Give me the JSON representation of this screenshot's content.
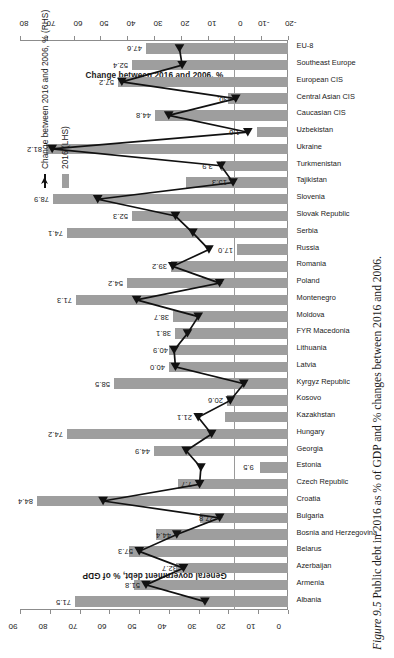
{
  "caption": {
    "number": "Figure 9.5",
    "text": "Public debt in 2016 as % of GDP and % changes between 2016 and 2006."
  },
  "legend": {
    "position": "right",
    "items": [
      {
        "label": "2016 (LHS)",
        "marker": "bar-swatch",
        "color": "#9e9e9e"
      },
      {
        "label": "Change between 2016 and 2006, % (RHS)",
        "marker": "line-marker",
        "color": "#111111"
      }
    ]
  },
  "chart_data": {
    "type": "bar",
    "title": "",
    "xlabel": "",
    "ylabel": "General government debt, % of GDP",
    "y2label": "Change between 2016 and 2006, %",
    "ylim": [
      0,
      90
    ],
    "y2lim": [
      -20,
      80
    ],
    "yticks": [
      0,
      10,
      20,
      30,
      40,
      50,
      60,
      70,
      80,
      90
    ],
    "y2ticks": [
      -20,
      -10,
      0,
      10,
      20,
      30,
      40,
      50,
      60,
      70,
      80
    ],
    "grid": false,
    "orientation": "vertical-bars-rotated-page",
    "categories": [
      "Albania",
      "Armenia",
      "Azerbaijan",
      "Belarus",
      "Bosnia and Herzegovina",
      "Bulgaria",
      "Croatia",
      "Czech Republic",
      "Estonia",
      "Georgia",
      "Hungary",
      "Kazakhstan",
      "Kosovo",
      "Kyrgyz Republic",
      "Latvia",
      "Lithuania",
      "FYR Macedonia",
      "Moldova",
      "Montenegro",
      "Poland",
      "Romania",
      "Russia",
      "Serbia",
      "Slovak Republic",
      "Slovenia",
      "Tajikistan",
      "Turkmenistan",
      "Ukraine",
      "Uzbekistan",
      "Caucasian CIS",
      "Central Asian CIS",
      "European CIS",
      "Southeast Europe",
      "EU-8"
    ],
    "series": [
      {
        "name": "2016 (LHS)",
        "axis": "left",
        "type": "bar",
        "color": "#9e9e9e",
        "values": [
          71.5,
          51.8,
          37.7,
          53.5,
          44.4,
          29.5,
          84.4,
          36.8,
          9.5,
          44.9,
          74.2,
          21.0,
          20.6,
          58.5,
          40.0,
          40.1,
          38.1,
          38.7,
          71.3,
          54.2,
          39.2,
          17.0,
          74.1,
          52.3,
          78.9,
          34.3,
          22.4,
          81.2,
          10.5,
          44.8,
          20.1,
          57.2,
          52.4,
          47.6
        ]
      },
      {
        "name": "Change between 2016 and 2006, % (RHS)",
        "axis": "right",
        "type": "line",
        "color": "#111111",
        "values": [
          11.0,
          33.0,
          19.0,
          35.5,
          21.5,
          5.5,
          49.0,
          13.0,
          12.5,
          18.0,
          8.5,
          13.5,
          1.5,
          -3.5,
          22.0,
          22.5,
          17.5,
          13.5,
          36.5,
          5.5,
          23.0,
          9.5,
          15.5,
          22.0,
          51.0,
          0.5,
          5.0,
          68.0,
          -5.0,
          24.5,
          -0.5,
          42.0,
          19.5,
          20.5
        ]
      }
    ],
    "bar_value_labels": [
      {
        "category": "Albania",
        "value": "71.5"
      },
      {
        "category": "Croatia",
        "value": "84.4"
      },
      {
        "category": "Estonia",
        "value": "9.5"
      },
      {
        "category": "Georgia",
        "value": "44.9"
      },
      {
        "category": "Hungary",
        "value": "74.2"
      },
      {
        "category": "Kosovo",
        "value": "20.6"
      },
      {
        "category": "Kyrgyz Republic",
        "value": "58.5"
      },
      {
        "category": "Latvia",
        "value": "40.0"
      },
      {
        "category": "FYR Macedonia",
        "value": "38.1"
      },
      {
        "category": "Moldova",
        "value": "38.7"
      },
      {
        "category": "Montenegro",
        "value": "71.3"
      },
      {
        "category": "Poland",
        "value": "54.2"
      },
      {
        "category": "Russia",
        "value": "17.0"
      },
      {
        "category": "Serbia",
        "value": "74.1"
      },
      {
        "category": "Slovak Republic",
        "value": "52.3"
      },
      {
        "category": "Slovenia",
        "value": "78.9"
      },
      {
        "category": "Ukraine",
        "value": "81.2"
      },
      {
        "category": "Caucasian CIS",
        "value": "44.8"
      },
      {
        "category": "European CIS",
        "value": "57.2"
      },
      {
        "category": "Southeast Europe",
        "value": "52.4"
      },
      {
        "category": "EU-8",
        "value": "47.6"
      }
    ],
    "point_value_labels": [
      {
        "category": "Armenia",
        "value": "51.8"
      },
      {
        "category": "Azerbaijan",
        "value": "32.7"
      },
      {
        "category": "Belarus",
        "value": "57.3"
      },
      {
        "category": "Bosnia and Herzegovina",
        "value": "44.4"
      },
      {
        "category": "Bulgaria",
        "value": "27.8"
      },
      {
        "category": "Czech Republic",
        "value": "7.7"
      },
      {
        "category": "Kazakhstan",
        "value": "21.1"
      },
      {
        "category": "Lithuania",
        "value": "40.9"
      },
      {
        "category": "Romania",
        "value": "39.2"
      },
      {
        "category": "Tajikistan",
        "value": "15.3"
      },
      {
        "category": "Turkmenistan",
        "value": "3.9"
      },
      {
        "category": "Uzbekistan",
        "value": "1.6"
      },
      {
        "category": "Central Asian CIS",
        "value": "30."
      }
    ]
  }
}
